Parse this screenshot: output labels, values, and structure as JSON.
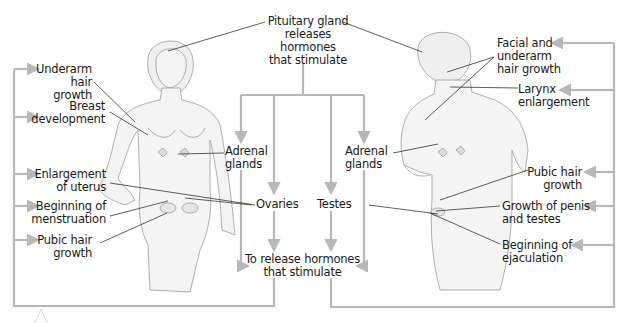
{
  "colors": {
    "flow_line": "#b8b8b8",
    "leader_line": "#333333",
    "figure_stroke": "#9a9a9a",
    "figure_fill": "#f4f4f4",
    "text": "#1a1a1a"
  },
  "center": {
    "pituitary": [
      "Pituitary gland",
      "releases",
      "hormones",
      "that stimulate"
    ],
    "adrenal_left": [
      "Adrenal",
      "glands"
    ],
    "adrenal_right": [
      "Adrenal",
      "glands"
    ],
    "ovaries": "Ovaries",
    "testes": "Testes",
    "release": [
      "To release hormones",
      "that stimulate"
    ]
  },
  "female": {
    "figure": "female-figure",
    "labels": [
      [
        "Underarm",
        "hair growth"
      ],
      [
        "Breast",
        "development"
      ],
      [
        "Enlargement",
        "of uterus"
      ],
      [
        "Beginning of",
        "menstruation"
      ],
      [
        "Pubic hair",
        "growth"
      ]
    ]
  },
  "male": {
    "figure": "male-figure",
    "labels": [
      [
        "Facial and",
        "underarm",
        "hair growth"
      ],
      [
        "Larynx",
        "enlargement"
      ],
      [
        "Pubic hair",
        "growth"
      ],
      [
        "Growth of penis",
        "and testes"
      ],
      [
        "Beginning of",
        "ejaculation"
      ]
    ]
  }
}
